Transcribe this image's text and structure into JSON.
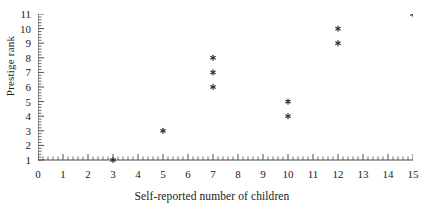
{
  "chart_data": {
    "type": "scatter",
    "title": "",
    "xlabel": "Self-reported number of children",
    "ylabel": "Prestige rank",
    "xlim": [
      0,
      15
    ],
    "ylim": [
      1,
      11
    ],
    "xticks": [
      0,
      1,
      2,
      3,
      4,
      5,
      6,
      7,
      8,
      9,
      10,
      11,
      12,
      13,
      14,
      15
    ],
    "yticks": [
      1,
      2,
      3,
      4,
      5,
      6,
      7,
      8,
      9,
      10,
      11
    ],
    "xtick_labels": [
      "0",
      "1",
      "2",
      "3",
      "4",
      "5",
      "6",
      "7",
      "8",
      "9",
      "10",
      "11",
      "12",
      "13",
      "14",
      "15"
    ],
    "ytick_labels": [
      "1",
      "2",
      "3",
      "4",
      "5",
      "6",
      "7",
      "8",
      "9",
      "10",
      "11"
    ],
    "minor_ticks": true,
    "minor_ticks_per_interval": 5,
    "grid": false,
    "legend": null,
    "marker": "star",
    "marker_color": "#2b2b2b",
    "axis_color": "#4a4a4a",
    "points": [
      {
        "x": 3,
        "y": 1
      },
      {
        "x": 5,
        "y": 3
      },
      {
        "x": 7,
        "y": 6
      },
      {
        "x": 7,
        "y": 7
      },
      {
        "x": 7,
        "y": 8
      },
      {
        "x": 10,
        "y": 4
      },
      {
        "x": 10,
        "y": 5
      },
      {
        "x": 12,
        "y": 9
      },
      {
        "x": 12,
        "y": 10
      },
      {
        "x": 15,
        "y": 11
      }
    ]
  }
}
